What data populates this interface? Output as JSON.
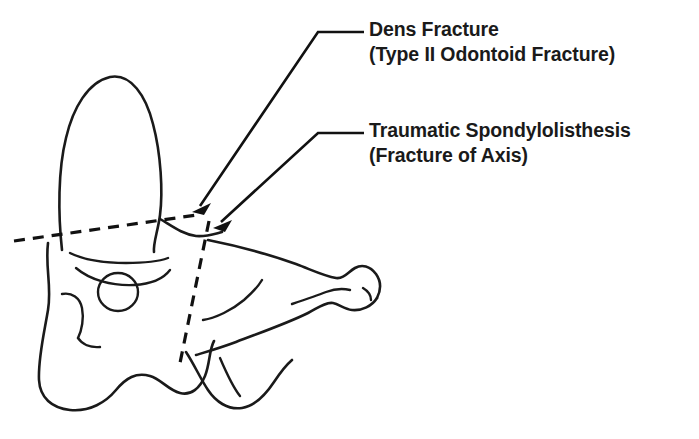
{
  "figure": {
    "background_color": "#ffffff",
    "ink_color": "#1a1a1a"
  },
  "callouts": [
    {
      "id": "dens-fracture",
      "line1": "Dens Fracture",
      "line2": "(Type II Odontoid Fracture)",
      "arrow_tip": {
        "x": 192,
        "y": 212
      }
    },
    {
      "id": "traumatic-spondylolisthesis",
      "line1": "Traumatic Spondylolisthesis",
      "line2": "(Fracture of Axis)",
      "arrow_tip": {
        "x": 213,
        "y": 228
      }
    }
  ],
  "fracture_lines": [
    {
      "id": "dens-base-fracture-line",
      "style": "dashed",
      "orientation": "oblique-horizontal",
      "from": {
        "x": 14,
        "y": 241
      },
      "to": {
        "x": 197,
        "y": 215
      }
    },
    {
      "id": "pars-interarticularis-fracture-line",
      "style": "dashed",
      "orientation": "near-vertical",
      "from": {
        "x": 209,
        "y": 221
      },
      "to": {
        "x": 180,
        "y": 363
      }
    }
  ],
  "anatomy_labels": [
    "dens (odontoid process)",
    "vertebral body",
    "transverse foramen",
    "pars interarticularis",
    "inferior articular process",
    "spinous process"
  ]
}
